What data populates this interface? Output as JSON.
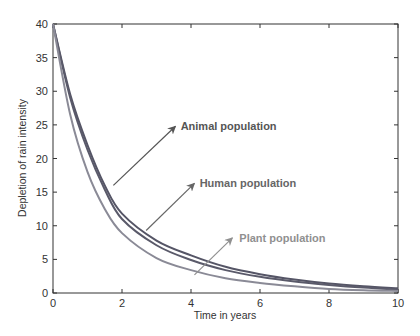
{
  "chart_data": {
    "type": "line",
    "title": "",
    "xlabel": "Time in years",
    "ylabel": "Depletion of rain intensity",
    "xlim": [
      0,
      10
    ],
    "ylim": [
      0,
      40
    ],
    "xticks": [
      0,
      2,
      4,
      6,
      8,
      10
    ],
    "yticks": [
      0,
      5,
      10,
      15,
      20,
      25,
      30,
      35,
      40
    ],
    "grid": false,
    "legend": null,
    "x": [
      0,
      0.5,
      1,
      1.5,
      2,
      3,
      4,
      5,
      6,
      7,
      8,
      9,
      10
    ],
    "series": [
      {
        "name": "Animal population",
        "color": "#555566",
        "values": [
          40,
          29.5,
          22.0,
          16.0,
          11.8,
          7.8,
          5.6,
          3.9,
          2.8,
          2.0,
          1.4,
          1.0,
          0.7
        ]
      },
      {
        "name": "Human population",
        "color": "#5a5a6a",
        "values": [
          40,
          29.0,
          21.3,
          15.4,
          11.0,
          7.1,
          4.9,
          3.4,
          2.4,
          1.7,
          1.2,
          0.8,
          0.5
        ]
      },
      {
        "name": "Plant population",
        "color": "#8a8a96",
        "values": [
          40,
          26.5,
          18.0,
          12.5,
          8.9,
          5.2,
          3.4,
          2.2,
          1.5,
          1.0,
          0.6,
          0.4,
          0.3
        ]
      }
    ],
    "annotations": [
      {
        "text": "Animal population",
        "arrow_from": [
          1.75,
          16.0
        ],
        "arrow_to": [
          3.55,
          24.8
        ],
        "text_pos": [
          3.7,
          24.8
        ],
        "color": "#555555"
      },
      {
        "text": "Human population",
        "arrow_from": [
          2.7,
          9.3
        ],
        "arrow_to": [
          4.1,
          16.3
        ],
        "text_pos": [
          4.25,
          16.3
        ],
        "color": "#666666"
      },
      {
        "text": "Plant population",
        "arrow_from": [
          4.1,
          2.7
        ],
        "arrow_to": [
          5.2,
          8.2
        ],
        "text_pos": [
          5.4,
          8.2
        ],
        "color": "#909090"
      }
    ]
  },
  "labels": {
    "xlabel": "Time in years",
    "ylabel": "Depletion of rain intensity",
    "annot_animal": "Animal population",
    "annot_human": "Human population",
    "annot_plant": "Plant population"
  }
}
